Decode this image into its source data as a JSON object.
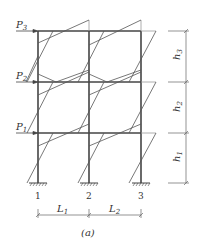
{
  "figure": {
    "caption": "(a)",
    "type": "three-story two-bay frame with lateral loads and moment diagrams"
  },
  "loads": [
    {
      "label": "P",
      "sub": "3",
      "y": 31
    },
    {
      "label": "P",
      "sub": "2",
      "y": 82
    },
    {
      "label": "P",
      "sub": "1",
      "y": 133
    }
  ],
  "columns": [
    {
      "label": "1",
      "x": 38
    },
    {
      "label": "2",
      "x": 89
    },
    {
      "label": "3",
      "x": 141
    }
  ],
  "spans": [
    {
      "label": "L",
      "sub": "1"
    },
    {
      "label": "L",
      "sub": "2"
    }
  ],
  "heights": [
    {
      "label": "h",
      "sub": "3"
    },
    {
      "label": "h",
      "sub": "2"
    },
    {
      "label": "h",
      "sub": "1"
    }
  ],
  "colors": {
    "frame": "#444444",
    "moment": "#555555",
    "dim": "#666666"
  }
}
